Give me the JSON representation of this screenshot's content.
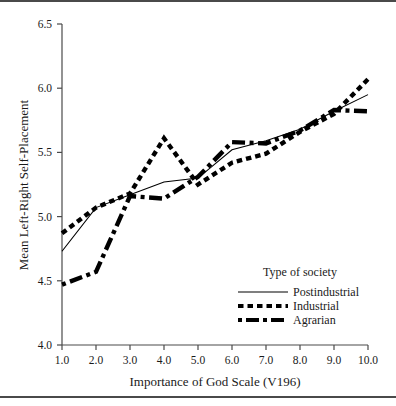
{
  "figure": {
    "name": "line-chart-figure"
  },
  "chart_data": {
    "type": "line",
    "title": "",
    "xlabel": "Importance of God Scale (V196)",
    "ylabel": "Mean Left-Right Self-Placement",
    "x": [
      1.0,
      2.0,
      3.0,
      4.0,
      5.0,
      6.0,
      7.0,
      8.0,
      9.0,
      10.0
    ],
    "xtick_labels": [
      "1.0",
      "2.0",
      "3.0",
      "4.0",
      "5.0",
      "6.0",
      "7.0",
      "8.0",
      "9.0",
      "10.0"
    ],
    "ytick_labels": [
      "4.0",
      "4.5",
      "5.0",
      "5.5",
      "6.0",
      "6.5"
    ],
    "ytick_values": [
      4.0,
      4.5,
      5.0,
      5.5,
      6.0,
      6.5
    ],
    "xlim": [
      1.0,
      10.0
    ],
    "ylim": [
      4.0,
      6.5
    ],
    "grid": false,
    "legend_position": "lower-right-inside",
    "series": [
      {
        "name": "Postindustrial",
        "style": "solid",
        "color": "#000000",
        "values": [
          4.73,
          5.07,
          5.17,
          5.27,
          5.3,
          5.52,
          5.59,
          5.68,
          5.82,
          5.95
        ]
      },
      {
        "name": "Industrial",
        "style": "dotted",
        "color": "#000000",
        "values": [
          4.87,
          5.07,
          5.18,
          5.61,
          5.25,
          5.42,
          5.49,
          5.66,
          5.8,
          6.07
        ]
      },
      {
        "name": "Agrarian",
        "style": "dash-dot",
        "color": "#000000",
        "values": [
          4.47,
          4.57,
          5.16,
          5.14,
          5.31,
          5.58,
          5.57,
          5.67,
          5.83,
          5.82
        ]
      }
    ]
  },
  "legend": {
    "title": "Type of society",
    "entries": [
      {
        "label": "Postindustrial",
        "style": "solid"
      },
      {
        "label": "Industrial",
        "style": "dotted"
      },
      {
        "label": "Agrarian",
        "style": "dash-dot"
      }
    ]
  }
}
